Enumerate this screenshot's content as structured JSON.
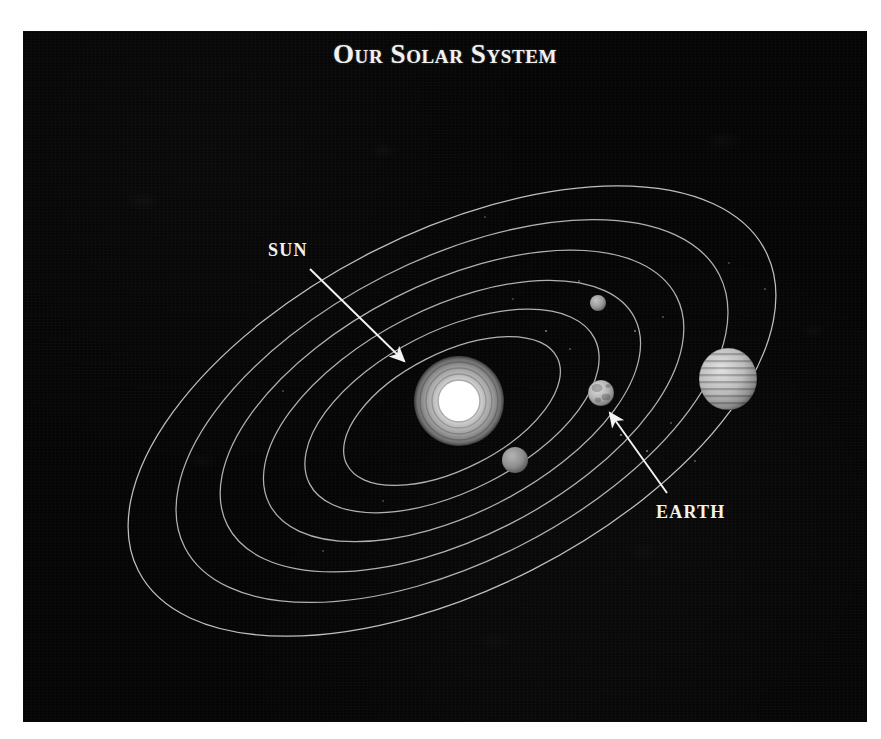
{
  "figure": {
    "title": "Our Solar System",
    "kind": "solar-system-diagram",
    "background_color": "#050505",
    "page_color": "#ffffff",
    "orbit_line_color": "#c9c9c9",
    "label_color": "#f2f2f2",
    "plate": {
      "x": 23,
      "y": 31,
      "width": 844,
      "height": 691
    }
  },
  "callouts": [
    {
      "name": "sun",
      "label": "SUN",
      "label_x": 245,
      "label_y": 218,
      "arrow_from_x": 287,
      "arrow_from_y": 238,
      "arrow_to_x": 381,
      "arrow_to_y": 330
    },
    {
      "name": "earth",
      "label": "EARTH",
      "label_x": 633,
      "label_y": 480,
      "arrow_from_x": 644,
      "arrow_from_y": 462,
      "arrow_to_x": 587,
      "arrow_to_y": 382
    }
  ],
  "chart_data": {
    "type": "scatter",
    "title": "Our Solar System",
    "xlabel": "",
    "ylabel": "",
    "grid": false,
    "legend": "none",
    "annotations": [
      "SUN",
      "EARTH"
    ],
    "orbits": [
      {
        "index": 1,
        "rx": 118,
        "ry": 58,
        "cx": 429,
        "cy": 380,
        "rotation_deg": -27
      },
      {
        "index": 2,
        "rx": 160,
        "ry": 80,
        "cx": 429,
        "cy": 380,
        "rotation_deg": -27
      },
      {
        "index": 3,
        "rx": 205,
        "ry": 103,
        "cx": 429,
        "cy": 380,
        "rotation_deg": -27
      },
      {
        "index": 4,
        "rx": 252,
        "ry": 127,
        "cx": 429,
        "cy": 380,
        "rotation_deg": -27
      },
      {
        "index": 5,
        "rx": 300,
        "ry": 151,
        "cx": 429,
        "cy": 380,
        "rotation_deg": -27
      },
      {
        "index": 6,
        "rx": 352,
        "ry": 178,
        "cx": 429,
        "cy": 380,
        "rotation_deg": -27
      }
    ],
    "bodies": [
      {
        "name": "sun",
        "cx": 436,
        "cy": 370,
        "radius": 45,
        "color": "#d8d8d8",
        "style": "star"
      },
      {
        "name": "inner-planet-1",
        "cx": 492,
        "cy": 429,
        "radius": 13,
        "color": "#8e8e8e",
        "style": "plain"
      },
      {
        "name": "earth",
        "cx": 578,
        "cy": 362,
        "radius": 13,
        "color": "#bdbdbd",
        "style": "mottled"
      },
      {
        "name": "inner-planet-2",
        "cx": 575,
        "cy": 272,
        "radius": 8,
        "color": "#9a9a9a",
        "style": "plain"
      },
      {
        "name": "gas-giant",
        "cx": 705,
        "cy": 348,
        "radius": 29,
        "color": "#c2c2c2",
        "style": "banded"
      }
    ]
  }
}
